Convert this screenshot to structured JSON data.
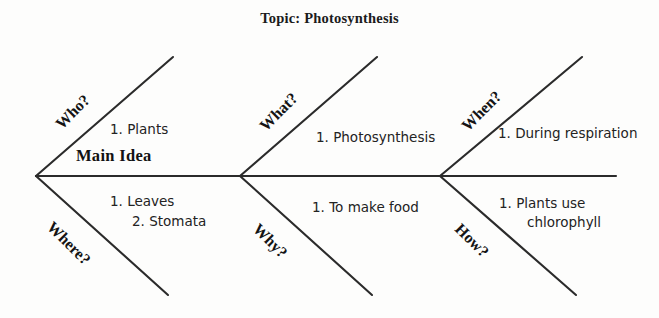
{
  "title": "Topic: Photosynthesis",
  "center_label": "Main Idea",
  "colors": {
    "background": "#fdfdfc",
    "line": "#2b2b2b",
    "title_text": "#1b1b1b",
    "note_text": "#232323",
    "category_text": "#141414"
  },
  "spine": {
    "y": 176,
    "x_start": 36,
    "x_end": 616,
    "arrow_vertices_x": [
      36,
      240,
      440
    ]
  },
  "branches": [
    {
      "id": "who",
      "category": "Who?",
      "position": "upper",
      "section": 1,
      "notes": [
        "1. Plants"
      ]
    },
    {
      "id": "where",
      "category": "Where?",
      "position": "lower",
      "section": 1,
      "notes": [
        "1. Leaves",
        "2. Stomata"
      ]
    },
    {
      "id": "what",
      "category": "What?",
      "position": "upper",
      "section": 2,
      "notes": [
        "1. Photosynthesis"
      ]
    },
    {
      "id": "why",
      "category": "Why?",
      "position": "lower",
      "section": 2,
      "notes": [
        "1. To make food"
      ]
    },
    {
      "id": "when",
      "category": "When?",
      "position": "upper",
      "section": 3,
      "notes": [
        "1. During respiration"
      ]
    },
    {
      "id": "how",
      "category": "How?",
      "position": "lower",
      "section": 3,
      "notes": [
        "1. Plants use",
        "chlorophyll"
      ]
    }
  ],
  "notes_text": {
    "who_1": "1. Plants",
    "where_1": "1. Leaves",
    "where_2": "2. Stomata",
    "what_1": "1. Photosynthesis",
    "why_1": "1. To make food",
    "when_1": "1. During respiration",
    "how_1": "1. Plants use",
    "how_2": "chlorophyll"
  },
  "categories_text": {
    "who": "Who?",
    "where": "Where?",
    "what": "What?",
    "why": "Why?",
    "when": "When?",
    "how": "How?"
  }
}
